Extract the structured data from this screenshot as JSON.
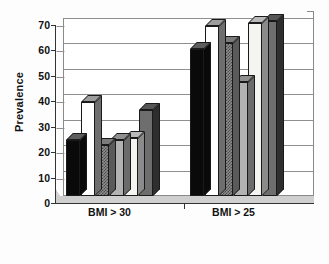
{
  "chart_data": {
    "type": "bar",
    "title": "",
    "xlabel": "",
    "ylabel": "Prevalence",
    "categories": [
      "BMI > 30",
      "BMI > 25"
    ],
    "ylim": [
      0,
      70
    ],
    "yticks": [
      0,
      10,
      20,
      30,
      40,
      50,
      60,
      70
    ],
    "grid": true,
    "legend": "none",
    "style": "3d-column",
    "series": [
      {
        "name": "Series 1",
        "fill": "black",
        "values": [
          22,
          58
        ]
      },
      {
        "name": "Series 2",
        "fill": "white",
        "values": [
          37,
          67
        ]
      },
      {
        "name": "Series 3",
        "fill": "stipple",
        "values": [
          20,
          60
        ]
      },
      {
        "name": "Series 4",
        "fill": "gray",
        "values": [
          22,
          45
        ]
      },
      {
        "name": "Series 5",
        "fill": "cream",
        "values": [
          23,
          68
        ]
      },
      {
        "name": "Series 6",
        "fill": "dark",
        "values": [
          34,
          69
        ]
      }
    ]
  },
  "axis": {
    "y_title": "Prevalence",
    "y_tick_labels": [
      "70",
      "60",
      "50",
      "40",
      "30",
      "20",
      "10",
      "0"
    ],
    "x_tick_labels": [
      "BMI > 30",
      "BMI > 25"
    ]
  },
  "colors": {
    "axis": "#333333",
    "grid": "#8f8f8f",
    "frame": "#8a8a8a",
    "background": "#ffffff",
    "text": "#111111"
  }
}
